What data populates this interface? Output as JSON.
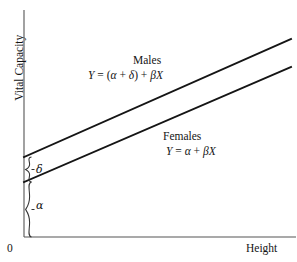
{
  "figure": {
    "background_color": "#ffffff",
    "line_color": "#1a1a1a",
    "axis_color": "#555555"
  },
  "axes": {
    "y_title": "Vital Capacity",
    "x_title": "Height",
    "origin_label": "0"
  },
  "annotations": {
    "males": {
      "name": "Males",
      "equation_prefix": "Y",
      "equation": "Y = (α + δ) + βX"
    },
    "females": {
      "name": "Females",
      "equation": "Y = α + βX"
    },
    "brace_delta": "δ",
    "brace_alpha": "α"
  },
  "chart_data": {
    "type": "line",
    "title": "",
    "xlabel": "Height",
    "ylabel": "Vital Capacity",
    "xlim": [
      0,
      1
    ],
    "ylim": [
      0,
      1
    ],
    "grid": false,
    "legend": "inline-annotations",
    "axis_ticks": {
      "x": [
        "0"
      ],
      "y": []
    },
    "series": [
      {
        "name": "Males",
        "equation": "Y = (α + δ) + βX",
        "intercept_label": "α + δ",
        "slope_label": "β",
        "x": [
          0,
          1
        ],
        "y": [
          0.355,
          0.888
        ]
      },
      {
        "name": "Females",
        "equation": "Y = α + βX",
        "intercept_label": "α",
        "slope_label": "β",
        "x": [
          0,
          1
        ],
        "y": [
          0.243,
          0.77
        ]
      }
    ],
    "annotations": [
      {
        "label": "δ",
        "type": "brace",
        "description": "vertical offset between male and female intercepts"
      },
      {
        "label": "α",
        "type": "brace",
        "description": "female intercept measured from origin"
      }
    ]
  }
}
